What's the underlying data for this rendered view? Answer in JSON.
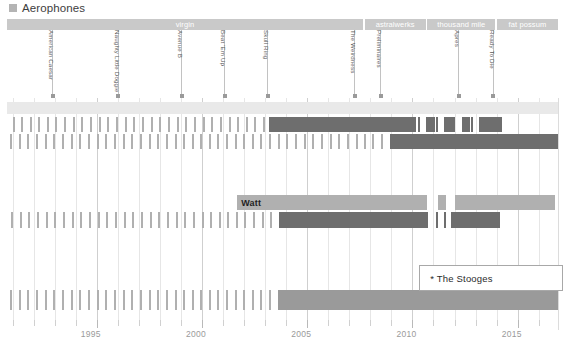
{
  "legend": {
    "swatch_color": "#b4b4b4",
    "label": "Aerophones",
    "icon": "square-swatch-icon"
  },
  "label_bar": {
    "segments": [
      {
        "name": "virgin",
        "start_pct": 0.0,
        "width_pct": 64.6
      },
      {
        "name": "astralwerks",
        "start_pct": 64.9,
        "width_pct": 11.1
      },
      {
        "name": "thousand mile",
        "start_pct": 76.3,
        "width_pct": 12.3
      },
      {
        "name": "fat possum",
        "start_pct": 88.9,
        "width_pct": 11.1
      }
    ]
  },
  "albums": [
    {
      "name": "American Caesar",
      "x_pct": 8.2
    },
    {
      "name": "Naughty Little Doggie",
      "x_pct": 20.1
    },
    {
      "name": "Avenue B",
      "x_pct": 31.6
    },
    {
      "name": "Beat 'Em Up",
      "x_pct": 39.4
    },
    {
      "name": "Skull Ring",
      "x_pct": 47.2
    },
    {
      "name": "The Weirdness",
      "x_pct": 63.0
    },
    {
      "name": "Preliminaires",
      "x_pct": 67.7
    },
    {
      "name": "Apres",
      "x_pct": 81.9
    },
    {
      "name": "Ready To Die",
      "x_pct": 88.2
    }
  ],
  "x_axis": {
    "labels": [
      "1995",
      "2000",
      "2005",
      "2010",
      "2015"
    ],
    "label_pct": [
      15.2,
      34.3,
      53.4,
      72.5,
      91.6
    ],
    "minor_step_pct": 3.82,
    "range": [
      1992.0,
      2016.6
    ]
  },
  "callout": {
    "text": "* The Stooges",
    "x_pct": 74.8,
    "y_px": 265,
    "width_px": 142,
    "height_px": 24
  },
  "chart_data": {
    "type": "bar",
    "title": "Aerophones",
    "xlabel": "",
    "ylabel": "",
    "grid": true,
    "legend_position": "top-left",
    "rows": [
      {
        "row": 0,
        "kind": "shade-band",
        "y_px": 4,
        "height_px": 12,
        "color": "#e9e9e9",
        "start_pct": 0,
        "width_pct": 100
      },
      {
        "row": 1,
        "label": "",
        "y_px": 19,
        "height_px": 15,
        "ticks_lite_pct": [
          1.0,
          2.6,
          4.1,
          5.7,
          7.3,
          8.8,
          10.4,
          12.0,
          13.5,
          15.1,
          16.7,
          18.2,
          19.8,
          21.4,
          22.9,
          24.5,
          26.1,
          27.6,
          29.2,
          30.8,
          32.3,
          33.9,
          35.5,
          37.0,
          38.6,
          40.2,
          41.8,
          43.3,
          44.9,
          46.5
        ],
        "runs": [
          {
            "start_pct": 47.6,
            "width_pct": 26.6,
            "shade": "dark"
          },
          {
            "start_pct": 76.1,
            "width_pct": 1.6,
            "shade": "dark"
          },
          {
            "start_pct": 79.3,
            "width_pct": 1.6,
            "shade": "dark"
          },
          {
            "start_pct": 82.5,
            "width_pct": 1.6,
            "shade": "dark"
          },
          {
            "start_pct": 85.7,
            "width_pct": 4.2,
            "shade": "dark"
          }
        ],
        "ticks_dark_pct": [
          74.6,
          77.8,
          81.0,
          84.2
        ]
      },
      {
        "row": 2,
        "label": "",
        "y_px": 36,
        "height_px": 15,
        "ticks_lite_pct": [
          0.6,
          2.2,
          3.7,
          5.3,
          6.9,
          8.4,
          10.0,
          11.6,
          13.1,
          14.7,
          16.3,
          17.8,
          19.4,
          21.0,
          22.5,
          24.1,
          25.7,
          27.2,
          28.8,
          30.4,
          31.9,
          33.5,
          35.1,
          36.6,
          38.2,
          39.8,
          41.3,
          42.9,
          44.5,
          46.0,
          47.6,
          49.2,
          50.7,
          52.3,
          53.9,
          55.4,
          57.0,
          58.6,
          60.1,
          61.7,
          63.3,
          64.8,
          66.3,
          67.9
        ],
        "runs": [
          {
            "start_pct": 69.5,
            "width_pct": 30.5,
            "shade": "dark"
          }
        ],
        "ticks_dark_pct": []
      },
      {
        "row": 3,
        "label": "Watt",
        "label_x_pct": 42.5,
        "y_px": 97,
        "height_px": 15,
        "ticks_lite_pct": [],
        "runs": [
          {
            "start_pct": 41.8,
            "width_pct": 34.5,
            "shade": "lite"
          },
          {
            "start_pct": 78.2,
            "width_pct": 1.5,
            "shade": "lite"
          },
          {
            "start_pct": 81.3,
            "width_pct": 18.1,
            "shade": "lite"
          }
        ],
        "ticks_dark_pct": []
      },
      {
        "row": 4,
        "label": "",
        "y_px": 114,
        "height_px": 16,
        "ticks_lite_pct": [
          0.8,
          2.4,
          3.9,
          5.5,
          7.1,
          8.6,
          10.2,
          11.8,
          13.3,
          14.9,
          16.5,
          18.0,
          19.6,
          21.2,
          22.7,
          24.3,
          25.9,
          27.4,
          29.0,
          30.6,
          32.1,
          33.7,
          35.3,
          36.8,
          38.4,
          40.0,
          41.5,
          43.1,
          44.7,
          46.2,
          47.8
        ],
        "runs": [
          {
            "start_pct": 49.4,
            "width_pct": 27.0,
            "shade": "dark"
          },
          {
            "start_pct": 80.5,
            "width_pct": 8.9,
            "shade": "dark"
          }
        ],
        "ticks_dark_pct": [
          77.8,
          79.3
        ]
      },
      {
        "row": 5,
        "label": "",
        "y_px": 192,
        "height_px": 20,
        "ticks_lite_pct": [
          0.6,
          2.2,
          3.7,
          5.3,
          6.9,
          8.4,
          10.0,
          11.6,
          13.1,
          14.7,
          16.3,
          17.8,
          19.4,
          21.0,
          22.5,
          24.1,
          25.7,
          27.2,
          28.8,
          30.4,
          31.9,
          33.5,
          35.1,
          36.6,
          38.2,
          39.8,
          41.3,
          42.9,
          44.5,
          46.0,
          47.6
        ],
        "runs": [
          {
            "start_pct": 49.2,
            "width_pct": 50.8,
            "shade": "mid"
          }
        ],
        "ticks_dark_pct": []
      }
    ]
  }
}
